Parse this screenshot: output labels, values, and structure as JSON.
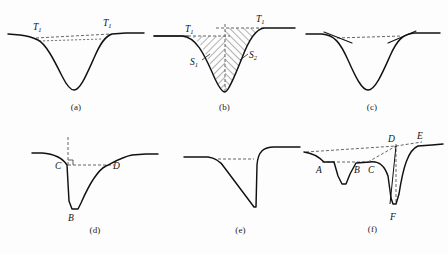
{
  "figure": {
    "background_color": "#fdfdfd",
    "line_color": "#111111",
    "dash_color": "#4a4a4a",
    "panel_count": 6
  },
  "panels": {
    "a": {
      "caption": "(a)",
      "description": "smooth-asymmetric-trough-with-shoulder-thresholds",
      "labels": {
        "left_threshold": "T",
        "left_threshold_sub": "1",
        "right_threshold": "T",
        "right_threshold_sub": "1"
      }
    },
    "b": {
      "caption": "(b)",
      "description": "hatched-area-trough-with-two-area-regions",
      "labels": {
        "left_threshold": "T",
        "left_threshold_sub": "1",
        "right_threshold": "T",
        "right_threshold_sub": "1",
        "left_area": "S",
        "left_area_sub": "1",
        "right_area": "S",
        "right_area_sub": "2"
      }
    },
    "c": {
      "caption": "(c)",
      "description": "symmetric-v-trough-with-tangent-segments"
    },
    "d": {
      "caption": "(d)",
      "description": "sharp-trough-with-right-angle-construction",
      "labels": {
        "left_point": "C",
        "right_point": "D",
        "minimum_point": "B"
      }
    },
    "e": {
      "caption": "(e)",
      "description": "linear-ramp-down-with-vertical-recovery"
    },
    "f": {
      "caption": "(f)",
      "description": "compound-double-trough-with-six-construction-points",
      "labels": {
        "p1": "A",
        "p2": "B",
        "p3": "C",
        "p4": "D",
        "p5": "E",
        "p6": "F"
      }
    }
  }
}
